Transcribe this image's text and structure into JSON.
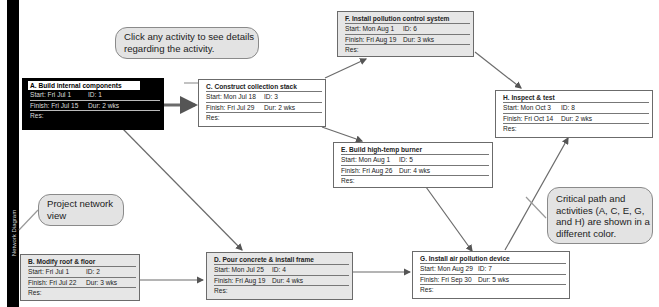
{
  "sidebar": {
    "label": "Network Diagram"
  },
  "callouts": {
    "click_hint": "Click any activity to see details regarding the activity.",
    "project_view": "Project network view",
    "critical_path": "Critical path and activities (A, C, E, G, and H) are shown in a different color."
  },
  "labels": {
    "start": "Start:",
    "finish": "Finish:",
    "id": "ID:",
    "dur": "Dur:",
    "res": "Res:"
  },
  "activities": {
    "A": {
      "title": "A. Build internal components",
      "start": "Fri Jul 1",
      "id": "1",
      "finish": "Fri Jul 15",
      "dur": "2 wks",
      "critical": true,
      "selected": true
    },
    "B": {
      "title": "B. Modify roof & floor",
      "start": "Fri Jul 1",
      "id": "2",
      "finish": "Fri Jul 22",
      "dur": "3 wks",
      "critical": false
    },
    "C": {
      "title": "C. Construct collection stack",
      "start": "Mon Jul 18",
      "id": "3",
      "finish": "Fri Jul 29",
      "dur": "2 wks",
      "critical": true
    },
    "D": {
      "title": "D. Pour concrete & install frame",
      "start": "Mon Jul 25",
      "id": "4",
      "finish": "Fri Aug 19",
      "dur": "4 wks",
      "critical": false
    },
    "E": {
      "title": "E. Build high-temp burner",
      "start": "Mon Aug 1",
      "id": "5",
      "finish": "Fri Aug 26",
      "dur": "4 wks",
      "critical": true
    },
    "F": {
      "title": "F. Install pollution control system",
      "start": "Mon Aug 1",
      "id": "6",
      "finish": "Fri Aug 19",
      "dur": "3 wks",
      "critical": false
    },
    "G": {
      "title": "G. Install air pollution device",
      "start": "Mon Aug 29",
      "id": "7",
      "finish": "Fri Sep 30",
      "dur": "5 wks",
      "critical": true
    },
    "H": {
      "title": "H. Inspect & test",
      "start": "Mon Oct 3",
      "id": "8",
      "finish": "Fri Oct 14",
      "dur": "2 wks",
      "critical": true
    }
  },
  "colors": {
    "critical_fill": "#ffffff",
    "noncritical_fill": "#e6e6e6",
    "selected_fill": "#000000",
    "link": "#6b6b6b"
  }
}
